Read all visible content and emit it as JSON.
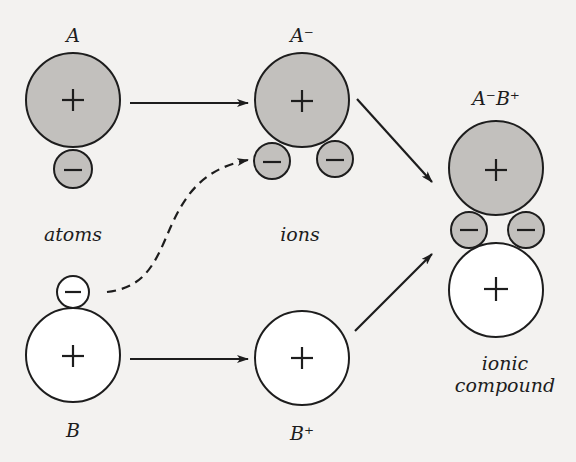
{
  "colors": {
    "background": "#f3f2f0",
    "shaded_fill": "#c2c0bd",
    "open_fill": "#ffffff",
    "stroke": "#1d1d1d"
  },
  "labels": {
    "atom_a": "A",
    "ion_a": "A⁻",
    "compound": "A⁻B⁺",
    "atom_b": "B",
    "ion_b": "B⁺",
    "atoms": "atoms",
    "ions": "ions",
    "ionic_line1": "ionic",
    "ionic_line2": "compound"
  },
  "signs": {
    "plus": "+",
    "minus": "−"
  },
  "arrows": [
    {
      "from": "A",
      "to": "A⁻",
      "style": "solid"
    },
    {
      "from": "B",
      "to": "B⁺",
      "style": "solid"
    },
    {
      "from": "B electron",
      "to": "A⁻ electron",
      "style": "dashed"
    },
    {
      "from": "A⁻",
      "to": "A⁻B⁺",
      "style": "solid"
    },
    {
      "from": "B⁺",
      "to": "A⁻B⁺",
      "style": "solid"
    }
  ]
}
